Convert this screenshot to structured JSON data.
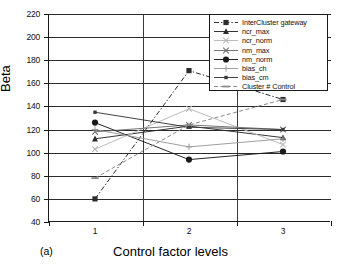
{
  "chart_data": {
    "type": "line",
    "title": "",
    "panel_label": "(a)",
    "xlabel": "Control factor levels",
    "ylabel": "Beta",
    "categories": [
      "1",
      "2",
      "3"
    ],
    "yticks": [
      220,
      200,
      180,
      160,
      140,
      120,
      100,
      80,
      60,
      40
    ],
    "ylim": [
      40,
      220
    ],
    "grid": true,
    "legend_position": "top-right",
    "series": [
      {
        "name": "InterCluster gateway",
        "values": [
          60,
          171,
          146
        ],
        "marker": "filled-square",
        "line": "dash-dot",
        "color": "#2b2b2b"
      },
      {
        "name": "ncr_max",
        "values": [
          112,
          123,
          113
        ],
        "marker": "filled-triangle",
        "line": "solid",
        "color": "#2b2b2b"
      },
      {
        "name": "ncr_norm",
        "values": [
          103,
          138,
          107
        ],
        "marker": "x-light",
        "line": "solid",
        "color": "#b8b8b8"
      },
      {
        "name": "nm_max",
        "values": [
          118,
          124,
          120
        ],
        "marker": "x",
        "line": "solid",
        "color": "#6e6e6e"
      },
      {
        "name": "nm_norm",
        "values": [
          126,
          94,
          101
        ],
        "marker": "filled-circle",
        "line": "solid",
        "color": "#1a1a1a"
      },
      {
        "name": "bias_ch",
        "values": [
          120,
          105,
          112
        ],
        "marker": "plus",
        "line": "solid",
        "color": "#9a9a9a"
      },
      {
        "name": "bias_cm",
        "values": [
          135,
          122,
          120
        ],
        "marker": "small-square",
        "line": "solid",
        "color": "#3a3a3a"
      },
      {
        "name": "Cluster # Control",
        "values": [
          78,
          124,
          146
        ],
        "marker": "dash",
        "line": "dashed",
        "color": "#8a8a8a"
      }
    ]
  },
  "legend": {
    "items": [
      "InterCluster gateway",
      "ncr_max",
      "ncr_norm",
      "nm_max",
      "nm_norm",
      "bias_ch",
      "bias_cm",
      "Cluster # Control"
    ]
  },
  "axes": {
    "y_title": "Beta",
    "x_title": "Control factor levels",
    "y_tick_labels": [
      "220",
      "200",
      "180",
      "160",
      "140",
      "120",
      "100",
      "80",
      "60",
      "40"
    ],
    "x_tick_labels": [
      "1",
      "2",
      "3"
    ]
  },
  "annotations": {
    "panel": "(a)"
  }
}
